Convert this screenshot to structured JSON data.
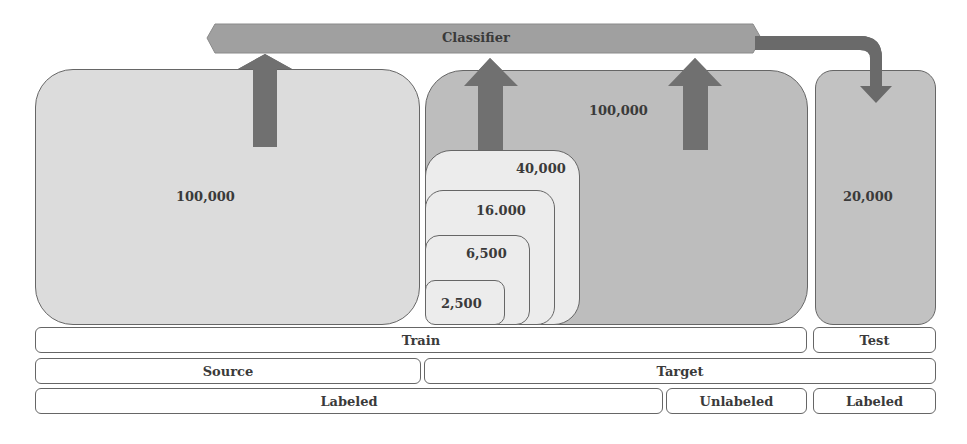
{
  "classifier": {
    "label": "Classifier"
  },
  "panels": {
    "source_train": {
      "count": "100,000"
    },
    "target_unlabeled": {
      "count": "100,000"
    },
    "target_labeled_subsets": [
      {
        "count": "40,000"
      },
      {
        "count": "16.000"
      },
      {
        "count": "6,500"
      },
      {
        "count": "2,500"
      }
    ],
    "test": {
      "count": "20,000"
    }
  },
  "rows": {
    "split": {
      "train": "Train",
      "test": "Test"
    },
    "domain": {
      "source": "Source",
      "target": "Target"
    },
    "labeling": {
      "labeled": "Labeled",
      "unlabeled": "Unlabeled",
      "test_labeled": "Labeled"
    }
  },
  "colors": {
    "classifier_bar": "#a0a0a0",
    "arrow": "#707070",
    "source_panel": "#dcdcdc",
    "target_panel": "#bdbdbd",
    "subset_panel": "#ececec",
    "test_panel": "#c2c2c2",
    "border": "#666666"
  }
}
